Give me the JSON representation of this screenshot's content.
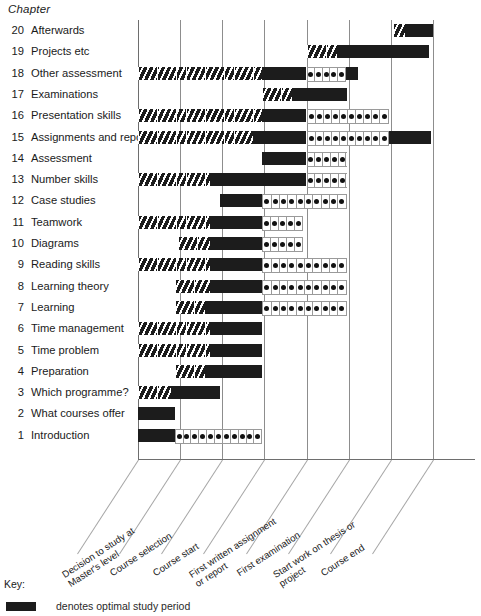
{
  "chart_data": {
    "type": "bar",
    "title": "Chapter",
    "subtitle": "",
    "xlabel": "",
    "ylabel": "Chapter",
    "grid": true,
    "legend_position": "bottom",
    "orientation": "horizontal",
    "columns": [
      "Decision to study at\nMaster's level",
      "Course selection",
      "Course start",
      "First written assignment\nor report",
      "First examination",
      "Start work on thesis or\nproject",
      "Course end"
    ],
    "column_count": 8,
    "fill_types": {
      "hatch": "preparatory / lead-in reading",
      "solid": "optimal study period",
      "dots": "review / ongoing reference"
    },
    "rows": [
      {
        "num": "20",
        "label": "Afterwards",
        "segments": [
          {
            "type": "hatch",
            "start": 6.05,
            "end": 6.35
          },
          {
            "type": "solid",
            "start": 6.35,
            "end": 7.0
          }
        ]
      },
      {
        "num": "19",
        "label": "Projects etc",
        "segments": [
          {
            "type": "hatch",
            "start": 4.0,
            "end": 4.72
          },
          {
            "type": "solid",
            "start": 4.72,
            "end": 6.9
          }
        ]
      },
      {
        "num": "18",
        "label": "Other assessment",
        "segments": [
          {
            "type": "hatch",
            "start": 0.0,
            "end": 2.95
          },
          {
            "type": "solid",
            "start": 2.95,
            "end": 4.0
          },
          {
            "type": "dots",
            "start": 4.0,
            "end": 4.93,
            "cells": 5
          },
          {
            "type": "solid",
            "start": 4.93,
            "end": 5.22
          }
        ]
      },
      {
        "num": "17",
        "label": "Examinations",
        "segments": [
          {
            "type": "hatch",
            "start": 2.95,
            "end": 3.66
          },
          {
            "type": "solid",
            "start": 3.66,
            "end": 4.95
          }
        ]
      },
      {
        "num": "16",
        "label": "Presentation skills",
        "segments": [
          {
            "type": "hatch",
            "start": 0.0,
            "end": 2.95
          },
          {
            "type": "solid",
            "start": 2.95,
            "end": 4.0
          },
          {
            "type": "dots",
            "start": 4.0,
            "end": 5.95,
            "cells": 10
          }
        ]
      },
      {
        "num": "15",
        "label": "Assignments and reports",
        "segments": [
          {
            "type": "hatch",
            "start": 0.0,
            "end": 2.72
          },
          {
            "type": "solid",
            "start": 2.72,
            "end": 4.0
          },
          {
            "type": "dots",
            "start": 4.0,
            "end": 5.95,
            "cells": 10
          },
          {
            "type": "solid",
            "start": 5.95,
            "end": 6.95
          }
        ]
      },
      {
        "num": "14",
        "label": "Assessment",
        "segments": [
          {
            "type": "solid",
            "start": 2.95,
            "end": 4.0
          },
          {
            "type": "dots",
            "start": 4.0,
            "end": 4.95,
            "cells": 5
          }
        ]
      },
      {
        "num": "13",
        "label": "Number skills",
        "segments": [
          {
            "type": "hatch",
            "start": 0.0,
            "end": 1.72
          },
          {
            "type": "solid",
            "start": 1.72,
            "end": 4.0
          },
          {
            "type": "dots",
            "start": 4.0,
            "end": 4.95,
            "cells": 5
          }
        ]
      },
      {
        "num": "12",
        "label": "Case studies",
        "segments": [
          {
            "type": "solid",
            "start": 1.95,
            "end": 2.95
          },
          {
            "type": "dots",
            "start": 2.95,
            "end": 4.95,
            "cells": 10
          }
        ]
      },
      {
        "num": "11",
        "label": "Teamwork",
        "segments": [
          {
            "type": "hatch",
            "start": 0.0,
            "end": 1.72
          },
          {
            "type": "solid",
            "start": 1.72,
            "end": 2.95
          },
          {
            "type": "dots",
            "start": 2.95,
            "end": 3.92,
            "cells": 5
          }
        ]
      },
      {
        "num": "10",
        "label": "Diagrams",
        "segments": [
          {
            "type": "hatch",
            "start": 0.95,
            "end": 1.72
          },
          {
            "type": "solid",
            "start": 1.72,
            "end": 2.95
          },
          {
            "type": "dots",
            "start": 2.95,
            "end": 3.92,
            "cells": 5
          }
        ]
      },
      {
        "num": "9",
        "label": "Reading skills",
        "segments": [
          {
            "type": "hatch",
            "start": 0.0,
            "end": 1.72
          },
          {
            "type": "solid",
            "start": 1.72,
            "end": 2.95
          },
          {
            "type": "dots",
            "start": 2.95,
            "end": 4.95,
            "cells": 10
          }
        ]
      },
      {
        "num": "8",
        "label": "Learning theory",
        "segments": [
          {
            "type": "hatch",
            "start": 0.87,
            "end": 1.72
          },
          {
            "type": "solid",
            "start": 1.72,
            "end": 2.95
          },
          {
            "type": "dots",
            "start": 2.95,
            "end": 4.95,
            "cells": 10
          }
        ]
      },
      {
        "num": "7",
        "label": "Learning",
        "segments": [
          {
            "type": "hatch",
            "start": 0.87,
            "end": 1.6
          },
          {
            "type": "solid",
            "start": 1.6,
            "end": 2.95
          },
          {
            "type": "dots",
            "start": 2.95,
            "end": 4.95,
            "cells": 10
          }
        ]
      },
      {
        "num": "6",
        "label": "Time management",
        "segments": [
          {
            "type": "hatch",
            "start": 0.0,
            "end": 1.72
          },
          {
            "type": "solid",
            "start": 1.72,
            "end": 2.95
          }
        ]
      },
      {
        "num": "5",
        "label": "Time problem",
        "segments": [
          {
            "type": "hatch",
            "start": 0.0,
            "end": 1.72
          },
          {
            "type": "solid",
            "start": 1.72,
            "end": 2.95
          }
        ]
      },
      {
        "num": "4",
        "label": "Preparation",
        "segments": [
          {
            "type": "hatch",
            "start": 0.87,
            "end": 1.6
          },
          {
            "type": "solid",
            "start": 1.6,
            "end": 2.95
          }
        ]
      },
      {
        "num": "3",
        "label": "Which programme?",
        "segments": [
          {
            "type": "hatch",
            "start": 0.0,
            "end": 0.78
          },
          {
            "type": "solid",
            "start": 0.78,
            "end": 1.95
          }
        ]
      },
      {
        "num": "2",
        "label": "What courses offer",
        "segments": [
          {
            "type": "solid",
            "start": 0.0,
            "end": 0.87
          }
        ]
      },
      {
        "num": "1",
        "label": "Introduction",
        "segments": [
          {
            "type": "solid",
            "start": 0.0,
            "end": 0.87
          },
          {
            "type": "dots",
            "start": 0.87,
            "end": 2.95,
            "cells": 11
          }
        ]
      }
    ]
  },
  "key": {
    "title": "Key:",
    "entries": [
      {
        "swatch": "solid",
        "text": "denotes optimal study period"
      }
    ]
  }
}
